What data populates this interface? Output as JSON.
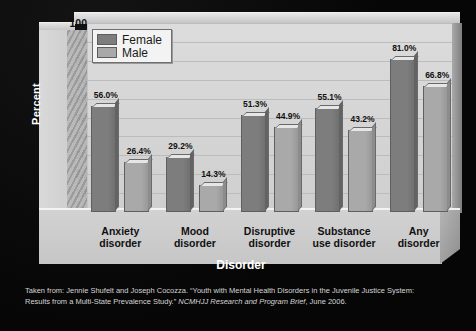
{
  "chart_data": {
    "type": "bar",
    "title": "",
    "xlabel": "Disorder",
    "ylabel": "Percent",
    "ylim": [
      0,
      100
    ],
    "ytick_step": 10,
    "yticks": [
      "100",
      "90",
      "80",
      "70",
      "60",
      "50",
      "40",
      "30",
      "20",
      "10",
      "0"
    ],
    "grid": true,
    "legend_position": "top-left",
    "categories": [
      "Anxiety disorder",
      "Mood disorder",
      "Disruptive disorder",
      "Substance use disorder",
      "Any disorder"
    ],
    "category_lines": [
      [
        "Anxiety",
        "disorder"
      ],
      [
        "Mood",
        "disorder"
      ],
      [
        "Disruptive",
        "disorder"
      ],
      [
        "Substance",
        "use disorder"
      ],
      [
        "Any",
        "disorder"
      ]
    ],
    "series": [
      {
        "name": "Female",
        "color": "#7d7d7d",
        "values": [
          56.0,
          29.2,
          51.3,
          55.1,
          81.0
        ],
        "labels": [
          "56.0%",
          "29.2%",
          "51.3%",
          "55.1%",
          "81.0%"
        ]
      },
      {
        "name": "Male",
        "color": "#a9a9a9",
        "values": [
          26.4,
          14.3,
          44.9,
          43.2,
          66.8
        ],
        "labels": [
          "26.4%",
          "14.3%",
          "44.9%",
          "43.2%",
          "66.8%"
        ]
      }
    ]
  },
  "legend": {
    "items": [
      {
        "label": "Female",
        "color": "#7d7d7d"
      },
      {
        "label": "Male",
        "color": "#a9a9a9"
      }
    ]
  },
  "caption": {
    "line1_part1": "Taken from: Jennie Shufelt and Joseph Cocozza. “Youth with Mental Health Disorders in the Juvenile Justice System:",
    "line2_part1": "Results from a Multi-State Prevalence Study.” ",
    "line2_italic": "NCMHJJ Research and Program Brief",
    "line2_part2": ", June 2006."
  }
}
